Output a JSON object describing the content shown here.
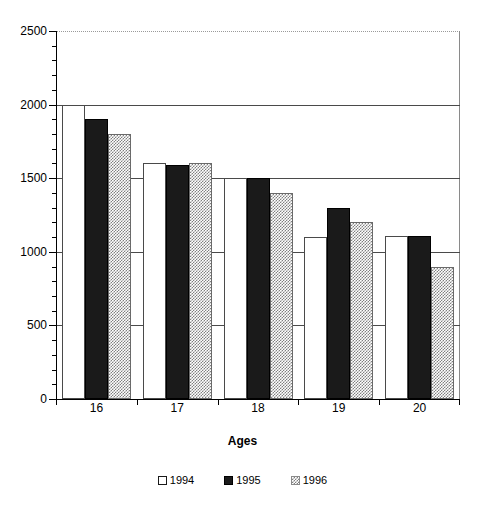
{
  "chart_data": {
    "type": "bar",
    "title": "",
    "xlabel": "Ages",
    "ylabel": "",
    "categories": [
      "16",
      "17",
      "18",
      "19",
      "20"
    ],
    "series": [
      {
        "name": "1994",
        "values": [
          2000,
          1600,
          1500,
          1100,
          1110
        ],
        "style": "white"
      },
      {
        "name": "1995",
        "values": [
          1900,
          1590,
          1500,
          1300,
          1110
        ],
        "style": "black"
      },
      {
        "name": "1996",
        "values": [
          1800,
          1600,
          1400,
          1200,
          900
        ],
        "style": "gray-hatch"
      }
    ],
    "ylim": [
      0,
      2500
    ],
    "ytick_labels": [
      "0",
      "500",
      "1000",
      "1500",
      "2000",
      "2500"
    ],
    "ytick_values": [
      0,
      500,
      1000,
      1500,
      2000,
      2500
    ],
    "minor_tick_interval": 100,
    "gridlines": [
      500,
      1000,
      1500,
      2000
    ],
    "grid": true,
    "legend_position": "bottom",
    "frame": true
  },
  "axis": {
    "x_title": "Ages"
  },
  "legend": {
    "entries": [
      {
        "label": "1994"
      },
      {
        "label": "1995"
      },
      {
        "label": "1996"
      }
    ]
  },
  "colors": {
    "series_1994": "#ffffff",
    "series_1995": "#1a1a1a",
    "series_1996": "#808080",
    "axis": "#000000",
    "gridline": "#4a4a4a",
    "frame": "#8a8a8a"
  }
}
